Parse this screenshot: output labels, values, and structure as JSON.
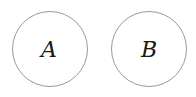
{
  "diagram": {
    "type": "nodes",
    "nodes": [
      {
        "id": "A",
        "label": "A",
        "cx": 50,
        "cy": 49,
        "r": 37.5
      },
      {
        "id": "B",
        "label": "B",
        "cx": 149,
        "cy": 49,
        "r": 37.5
      }
    ],
    "edges": [],
    "colors": {
      "stroke": "#9a9a9a",
      "fill": "#ffffff",
      "text": "#1a1a1a"
    }
  }
}
